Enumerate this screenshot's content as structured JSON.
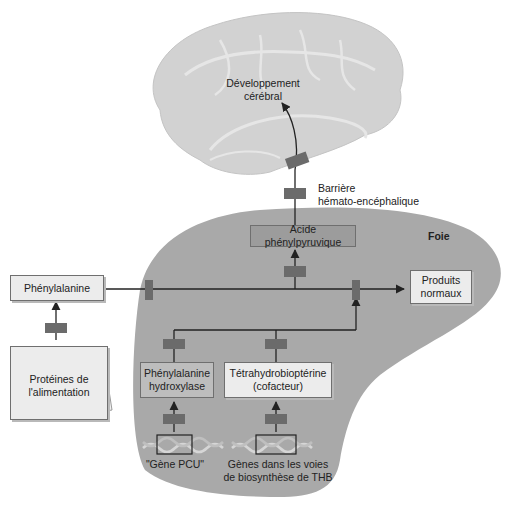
{
  "diagram": {
    "brain": {
      "label_line1": "Développement",
      "label_line2": "cérébral"
    },
    "barrier": {
      "label_line1": "Barrière",
      "label_line2": "hémato-encéphalique"
    },
    "liver": {
      "label": "Foie"
    },
    "nodes": {
      "phenylpyruvic_acid": "Acide phénylpyruvique",
      "phenylalanine": "Phénylalanine",
      "normal_products_line1": "Produits",
      "normal_products_line2": "normaux",
      "dietary_proteins_line1": "Protéines de",
      "dietary_proteins_line2": "l'alimentation",
      "phe_hydroxylase_line1": "Phénylalanine",
      "phe_hydroxylase_line2": "hydroxylase",
      "thb_line1": "Tétrahydrobioptérine",
      "thb_line2": "(cofacteur)",
      "pku_gene": "\"Gène PCU\"",
      "thb_genes_line1": "Gènes dans les voies",
      "thb_genes_line2": "de biosynthèse de THB"
    },
    "colors": {
      "liver_fill": "#a9a9a9",
      "brain_fill": "#d2d2d2",
      "block_marker": "#6b6b6b",
      "arrow": "#222222",
      "light_box": "#ececec",
      "mid_box": "#bdbdbd",
      "dark_box": "#9c9c9c"
    }
  }
}
